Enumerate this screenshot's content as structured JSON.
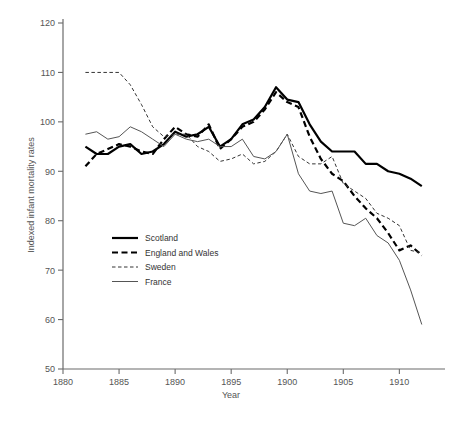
{
  "chart_data": {
    "type": "line",
    "title": "",
    "xlabel": "Year",
    "ylabel": "Indexed infant mortality rates",
    "xlim": [
      1880,
      1913
    ],
    "ylim": [
      50,
      120
    ],
    "xticks": [
      1880,
      1885,
      1890,
      1895,
      1900,
      1905,
      1910
    ],
    "yticks": [
      50,
      60,
      70,
      80,
      90,
      100,
      110,
      120
    ],
    "grid": false,
    "legend_position": "center-left",
    "series": [
      {
        "name": "Scotland",
        "style": "solid",
        "width": "thick",
        "color": "#000000",
        "x": [
          1882,
          1883,
          1884,
          1885,
          1886,
          1887,
          1888,
          1889,
          1890,
          1891,
          1892,
          1893,
          1894,
          1895,
          1896,
          1897,
          1898,
          1899,
          1900,
          1901,
          1902,
          1903,
          1904,
          1905,
          1906,
          1907,
          1908,
          1909,
          1910,
          1911,
          1912
        ],
        "y": [
          95,
          93.5,
          93.5,
          95,
          95.5,
          93.5,
          94,
          95.5,
          98,
          97,
          97.5,
          99,
          95,
          96.5,
          99.5,
          100.5,
          103,
          107,
          104.5,
          104,
          99.5,
          96,
          94,
          94,
          94,
          91.5,
          91.5,
          90,
          89.5,
          88.5,
          87
        ]
      },
      {
        "name": "England and Wales",
        "style": "dashed",
        "width": "thick",
        "color": "#000000",
        "x": [
          1882,
          1883,
          1884,
          1885,
          1886,
          1887,
          1888,
          1889,
          1890,
          1891,
          1892,
          1893,
          1894,
          1895,
          1896,
          1897,
          1898,
          1899,
          1900,
          1901,
          1902,
          1903,
          1904,
          1905,
          1906,
          1907,
          1908,
          1909,
          1910,
          1911,
          1912
        ],
        "y": [
          91,
          93.5,
          94.5,
          95.5,
          95,
          94,
          93.5,
          96.5,
          99,
          97.5,
          97,
          99.5,
          94.5,
          96.5,
          99,
          100,
          102.5,
          106,
          104,
          103,
          97,
          92.5,
          89.5,
          88,
          85,
          82.5,
          80.5,
          77.5,
          74,
          75,
          73
        ]
      },
      {
        "name": "Sweden",
        "style": "dashed",
        "width": "thin",
        "color": "#333333",
        "x": [
          1882,
          1883,
          1884,
          1885,
          1886,
          1887,
          1888,
          1889,
          1890,
          1891,
          1892,
          1893,
          1894,
          1895,
          1896,
          1897,
          1898,
          1899,
          1900,
          1901,
          1902,
          1903,
          1904,
          1905,
          1906,
          1907,
          1908,
          1909,
          1910,
          1911,
          1912
        ],
        "y": [
          110,
          110,
          110,
          110,
          107.5,
          103.5,
          99,
          97,
          97.5,
          97.5,
          95,
          94,
          92,
          92.5,
          93.5,
          91.5,
          92,
          94,
          97.5,
          93,
          91.5,
          91.5,
          93,
          87.5,
          86,
          84.5,
          81.5,
          80.5,
          79,
          74,
          73.5
        ]
      },
      {
        "name": "France",
        "style": "solid",
        "width": "thin",
        "color": "#555555",
        "x": [
          1882,
          1883,
          1884,
          1885,
          1886,
          1887,
          1888,
          1889,
          1890,
          1891,
          1892,
          1893,
          1894,
          1895,
          1896,
          1897,
          1898,
          1899,
          1900,
          1901,
          1902,
          1903,
          1904,
          1905,
          1906,
          1907,
          1908,
          1909,
          1910,
          1911,
          1912
        ],
        "y": [
          97.5,
          98,
          96.5,
          97,
          99,
          98,
          96.5,
          95,
          97.5,
          96.5,
          96,
          96.5,
          95,
          95,
          96.5,
          93,
          92.5,
          94,
          97.5,
          89.5,
          86,
          85.5,
          86,
          79.5,
          79,
          80.5,
          77,
          75.5,
          72,
          66,
          59
        ]
      }
    ]
  },
  "legend": {
    "items": [
      {
        "label": "Scotland"
      },
      {
        "label": "England and Wales"
      },
      {
        "label": "Sweden"
      },
      {
        "label": "France"
      }
    ]
  }
}
